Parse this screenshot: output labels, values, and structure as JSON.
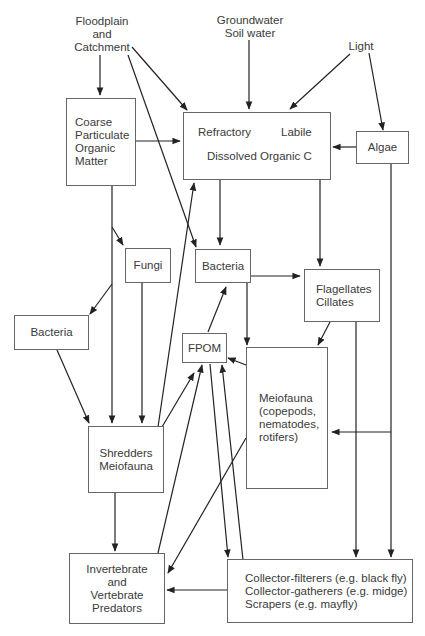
{
  "diagram": {
    "sources": {
      "floodplain": [
        "Floodplain",
        "and",
        "Catchment"
      ],
      "groundwater": [
        "Groundwater",
        "Soil water"
      ],
      "light": "Light"
    },
    "nodes": {
      "cpom": [
        "Coarse",
        "Particulate",
        "Organic",
        "Matter"
      ],
      "doc": {
        "refractory": "Refractory",
        "labile": "Labile",
        "title": "Dissolved Organic C"
      },
      "algae": "Algae",
      "fungi": "Fungi",
      "bacteria_top": "Bacteria",
      "bacteria_left": "Bacteria",
      "flagellates": [
        "Flagellates",
        "Cillates"
      ],
      "fpom": "FPOM",
      "meiofauna": [
        "Meiofauna",
        "(copepods,",
        "nematodes,",
        "rotifers)"
      ],
      "shredders": [
        "Shredders",
        "Meiofauna"
      ],
      "predators": [
        "Invertebrate",
        "and",
        "Vertebrate",
        "Predators"
      ],
      "collectors": [
        "Collector-filterers (e.g. black fly)",
        "Collector-gatherers (e.g. midge)",
        "Scrapers (e.g. mayfly)"
      ]
    },
    "colors": {
      "line": "#222222",
      "box_border": "#666666",
      "text": "#3a3a3a"
    }
  }
}
